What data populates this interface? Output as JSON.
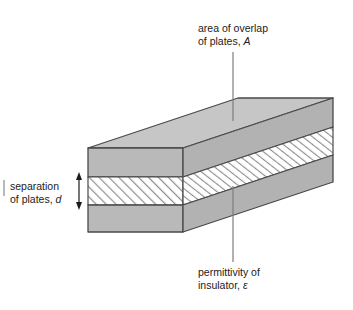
{
  "figure": {
    "type": "technical-diagram",
    "background_color": "#ffffff",
    "line_color": "#4a4a4a",
    "plate_fill": "#b9b9b9",
    "plate_fill_top": "#c6c6c6",
    "plate_fill_side": "#b0b0b0",
    "insulator_fill": "#ffffff",
    "hatch_color": "#8e8e8e",
    "text_color": "#1b1b1b"
  },
  "labels": {
    "area": {
      "line1": "area of overlap",
      "line2_prefix": "of plates, ",
      "line2_symbol": "A"
    },
    "permittivity": {
      "line1": "permittivity of",
      "line2_prefix": "insulator, ",
      "line2_symbol": "ε"
    },
    "separation": {
      "line1": "separation",
      "line2_prefix": "of plates, ",
      "line2_symbol": "d"
    }
  },
  "annotations": {
    "area_leader": "vertical leader line from area label down to top face of upper plate",
    "permittivity_leader": "vertical leader line from insulator layer down to permittivity label",
    "separation_arrow": "double-headed vertical arrow spanning the insulator thickness"
  },
  "geometry": {
    "front_face": {
      "left_x": 88,
      "right_x": 183,
      "top_y": 148,
      "bottom_y": 232
    },
    "insulator_band": {
      "top_y": 177,
      "bottom_y": 205
    },
    "depth_offset_x": 150,
    "depth_offset_y": -50
  }
}
